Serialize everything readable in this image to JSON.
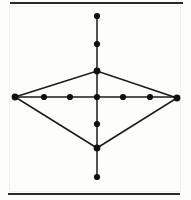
{
  "figure": {
    "canvas": {
      "width": 191,
      "height": 200
    },
    "colors": {
      "background": "#fdfdfc",
      "stroke": "#1a1a1a",
      "node_fill": "#111111",
      "rule": "#2b2b2b"
    },
    "style": {
      "edge_width": 1.6,
      "axis_width": 1.5,
      "rule_width": 1.9,
      "node_radius": 3.1,
      "vertex_radius": 3.4
    },
    "rules": [
      {
        "name": "top-rule",
        "x1": 10,
        "y1": 3,
        "x2": 183,
        "y2": 3
      },
      {
        "name": "bottom-rule",
        "x1": 8,
        "y1": 194,
        "x2": 180,
        "y2": 194
      }
    ],
    "axes": [
      {
        "name": "vertical-axis",
        "x1": 97,
        "y1": 16,
        "x2": 97,
        "y2": 177
      },
      {
        "name": "horizontal-axis",
        "x1": 15,
        "y1": 97,
        "x2": 177,
        "y2": 97
      }
    ],
    "diamond": {
      "name": "diamond-outline",
      "points": "15,97 97,71 177,98 97,148"
    },
    "vertices": [
      {
        "name": "left-vertex",
        "x": 15,
        "y": 97,
        "label": "left"
      },
      {
        "name": "right-vertex",
        "x": 177,
        "y": 98,
        "label": "right"
      },
      {
        "name": "top-vertex",
        "x": 97,
        "y": 71,
        "label": "top"
      },
      {
        "name": "bottom-vertex",
        "x": 97,
        "y": 148,
        "label": "bottom"
      }
    ],
    "nodes": [
      {
        "name": "node-h-left-outer",
        "x": 44,
        "y": 97,
        "axis": "horizontal"
      },
      {
        "name": "node-h-left-inner",
        "x": 70,
        "y": 97,
        "axis": "horizontal"
      },
      {
        "name": "node-center",
        "x": 97,
        "y": 97,
        "axis": "center"
      },
      {
        "name": "node-h-right-inner",
        "x": 123,
        "y": 97,
        "axis": "horizontal"
      },
      {
        "name": "node-h-right-outer",
        "x": 150,
        "y": 97,
        "axis": "horizontal"
      },
      {
        "name": "node-v-top-outer",
        "x": 97,
        "y": 16,
        "axis": "vertical"
      },
      {
        "name": "node-v-top-inner",
        "x": 97,
        "y": 44,
        "axis": "vertical"
      },
      {
        "name": "node-v-bottom-inner",
        "x": 97,
        "y": 124,
        "axis": "vertical"
      },
      {
        "name": "node-v-bottom-outer",
        "x": 97,
        "y": 177,
        "axis": "vertical"
      }
    ]
  },
  "chart_data": {
    "type": "scatter",
    "xlabel": "",
    "ylabel": "",
    "xlim": [
      0,
      191
    ],
    "ylim": [
      0,
      200
    ],
    "grid": false,
    "legend": null,
    "series": [
      {
        "name": "horizontal-axis-nodes",
        "x": [
          15,
          44,
          70,
          97,
          123,
          150,
          177
        ],
        "y": [
          97,
          97,
          97,
          97,
          97,
          97,
          98
        ]
      },
      {
        "name": "vertical-axis-nodes",
        "x": [
          97,
          97,
          97,
          97,
          97,
          97
        ],
        "y": [
          16,
          44,
          71,
          97,
          124,
          148
        ]
      },
      {
        "name": "vertical-axis-terminal",
        "x": [
          97
        ],
        "y": [
          177
        ]
      }
    ],
    "annotations": [
      "top horizontal rule",
      "bottom horizontal rule",
      "diamond outline connecting left, top, right, bottom vertices"
    ]
  }
}
